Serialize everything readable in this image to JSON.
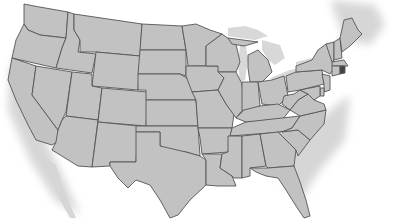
{
  "map": {
    "title": "United States",
    "highlighted_state": "Rhode Island",
    "colors": {
      "land": "#c2c2c2",
      "border": "#555555",
      "highlight": "#444444",
      "background": "#ffffff",
      "neighbors": "#d6d6d6"
    },
    "states": [
      "WA",
      "OR",
      "CA",
      "ID",
      "NV",
      "MT",
      "WY",
      "UT",
      "AZ",
      "CO",
      "NM",
      "ND",
      "SD",
      "NE",
      "KS",
      "OK",
      "TX",
      "MN",
      "IA",
      "MO",
      "AR",
      "LA",
      "WI",
      "IL",
      "MI",
      "IN",
      "OH",
      "KY",
      "TN",
      "MS",
      "AL",
      "GA",
      "FL",
      "SC",
      "NC",
      "VA",
      "WV",
      "PA",
      "NY",
      "VT",
      "NH",
      "ME",
      "MA",
      "CT",
      "RI",
      "NJ",
      "DE",
      "MD"
    ]
  }
}
